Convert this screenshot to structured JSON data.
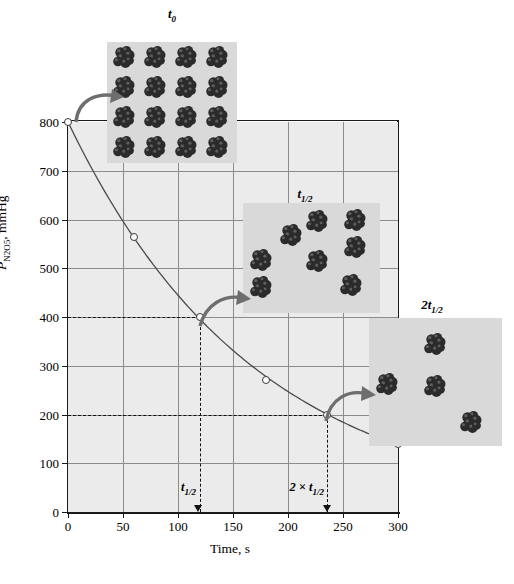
{
  "figure": {
    "title": "",
    "axis_title_x": "Time, s",
    "axis_title_y_main": "P",
    "axis_title_y_sub": "N2O5",
    "axis_title_y_tail": ", mmHg"
  },
  "chart_data": {
    "type": "line",
    "title": "",
    "xlabel": "Time, s",
    "ylabel": "P_N2O5, mmHg",
    "xlim": [
      0,
      300
    ],
    "ylim": [
      0,
      800
    ],
    "xticks": [
      0,
      50,
      100,
      150,
      200,
      250,
      300
    ],
    "yticks": [
      0,
      100,
      200,
      300,
      400,
      500,
      600,
      700,
      800
    ],
    "grid": true,
    "legend": "none",
    "x": [
      0,
      60,
      120,
      180,
      235,
      300
    ],
    "values": [
      800,
      565,
      400,
      270,
      200,
      140
    ],
    "series": [
      {
        "name": "N2O5 partial pressure decay",
        "x": [
          0,
          60,
          120,
          180,
          235,
          300
        ],
        "values": [
          800,
          565,
          400,
          270,
          200,
          140
        ]
      }
    ],
    "annotations": [
      {
        "name": "t-half-marker",
        "x": 118,
        "label": "t_1/2",
        "guide_y": 400
      },
      {
        "name": "2t-half-marker",
        "x": 235,
        "label": "2 x t_1/2",
        "guide_y": 200
      }
    ]
  },
  "ticks": {
    "y": [
      "800",
      "700",
      "600",
      "500",
      "400",
      "300",
      "200",
      "100",
      "0"
    ],
    "x": [
      "0",
      "50",
      "100",
      "150",
      "200",
      "250",
      "300"
    ]
  },
  "markers": {
    "t_half": {
      "label_t": "t",
      "label_sub": "1/2",
      "value": 118
    },
    "two_t_half": {
      "prefix": "2 × ",
      "label_t": "t",
      "label_sub": "1/2",
      "value": 235
    }
  },
  "insets": [
    {
      "name": "inset-t0",
      "label_main": "t",
      "label_sub": "0",
      "molecule_count": 16,
      "description": "N2O5 molecules at time zero"
    },
    {
      "name": "inset-t-half",
      "label_main": "t",
      "label_sub": "1/2",
      "molecule_count": 8,
      "description": "N2O5 molecules at one half-life"
    },
    {
      "name": "inset-two-t-half",
      "label_main": "2t",
      "label_sub": "1/2",
      "molecule_count": 4,
      "description": "N2O5 molecules at two half-lives"
    }
  ],
  "colors": {
    "plot_background": "#ebebeb",
    "inset_background": "#d9d9d9",
    "gridline": "#8c8c8c",
    "axis": "#1a1a1a",
    "curve": "#4a4a4a",
    "arrow": "#6e6e6e",
    "molecule": "#2b2b2b"
  }
}
